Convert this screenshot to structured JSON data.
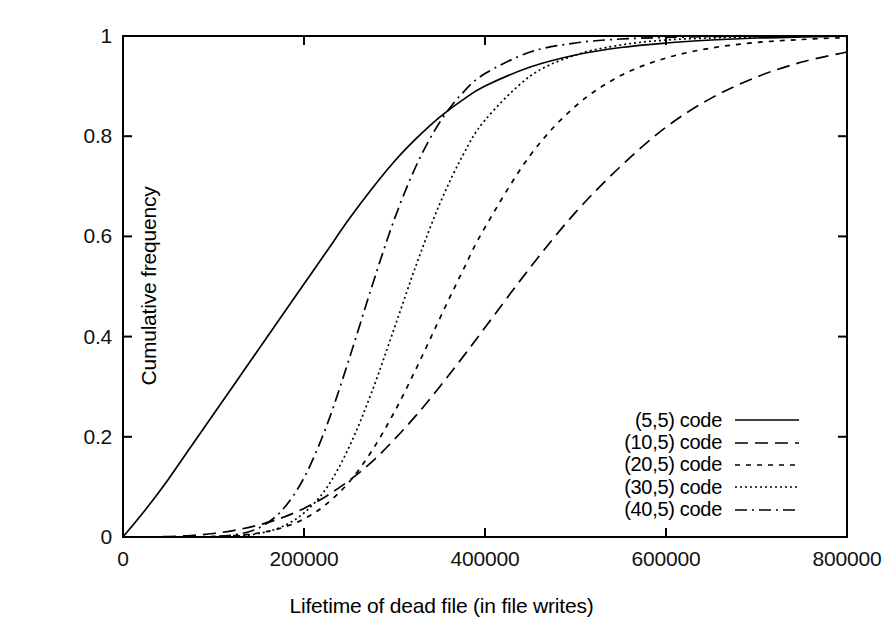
{
  "chart_data": {
    "type": "line",
    "title": "",
    "xlabel": "Lifetime of dead file (in file writes)",
    "ylabel": "Cumulative frequency",
    "xlim": [
      0,
      800000
    ],
    "ylim": [
      0,
      1
    ],
    "xticks": [
      "0",
      "200000",
      "400000",
      "600000",
      "800000"
    ],
    "xtick_values": [
      0,
      200000,
      400000,
      600000,
      800000
    ],
    "yticks": [
      "0",
      "0.2",
      "0.4",
      "0.6",
      "0.8",
      "1"
    ],
    "ytick_values": [
      0,
      0.2,
      0.4,
      0.6,
      0.8,
      1
    ],
    "grid": false,
    "legend_position": "lower right",
    "line_color": "#000000",
    "x": [
      0,
      25000,
      50000,
      75000,
      100000,
      125000,
      150000,
      175000,
      200000,
      225000,
      250000,
      275000,
      300000,
      325000,
      350000,
      375000,
      400000,
      450000,
      500000,
      550000,
      600000,
      650000,
      700000,
      750000,
      800000
    ],
    "series": [
      {
        "name": "(5,5) code",
        "dash": "solid",
        "values": [
          0,
          0.055,
          0.115,
          0.18,
          0.245,
          0.31,
          0.375,
          0.44,
          0.505,
          0.57,
          0.635,
          0.695,
          0.75,
          0.797,
          0.838,
          0.872,
          0.9,
          0.938,
          0.962,
          0.977,
          0.986,
          0.992,
          0.996,
          0.998,
          1.0
        ]
      },
      {
        "name": "(10,5) code",
        "dash": "dashed",
        "values": [
          0,
          0.0,
          0.001,
          0.003,
          0.007,
          0.014,
          0.024,
          0.038,
          0.057,
          0.082,
          0.113,
          0.15,
          0.195,
          0.245,
          0.3,
          0.358,
          0.418,
          0.538,
          0.648,
          0.74,
          0.818,
          0.876,
          0.918,
          0.948,
          0.968
        ]
      },
      {
        "name": "(20,5) code",
        "dash": "short-dashed",
        "values": [
          0,
          0.0,
          0.0,
          0.0,
          0.001,
          0.003,
          0.008,
          0.018,
          0.036,
          0.066,
          0.11,
          0.172,
          0.25,
          0.34,
          0.436,
          0.53,
          0.618,
          0.762,
          0.86,
          0.921,
          0.956,
          0.976,
          0.987,
          0.993,
          0.997
        ]
      },
      {
        "name": "(30,5) code",
        "dash": "dotted",
        "values": [
          0,
          0.0,
          0.0,
          0.0,
          0.0,
          0.002,
          0.007,
          0.02,
          0.048,
          0.098,
          0.18,
          0.29,
          0.418,
          0.548,
          0.665,
          0.76,
          0.832,
          0.92,
          0.962,
          0.982,
          0.992,
          0.996,
          0.998,
          0.999,
          1.0
        ]
      },
      {
        "name": "(40,5) code",
        "dash": "dash-dot",
        "values": [
          0,
          0.0,
          0.0,
          0.0,
          0.001,
          0.005,
          0.018,
          0.052,
          0.118,
          0.222,
          0.356,
          0.5,
          0.635,
          0.745,
          0.828,
          0.886,
          0.925,
          0.968,
          0.986,
          0.994,
          0.997,
          0.999,
          1.0,
          1.0,
          1.0
        ]
      }
    ]
  },
  "axis": {
    "x_labels": [
      "0",
      "200000",
      "400000",
      "600000",
      "800000"
    ],
    "y_labels": [
      "0",
      "0.2",
      "0.4",
      "0.6",
      "0.8",
      "1"
    ],
    "xlabel": "Lifetime of dead file (in file writes)",
    "ylabel": "Cumulative frequency"
  },
  "legend": {
    "items": [
      {
        "label": "(5,5) code"
      },
      {
        "label": "(10,5) code"
      },
      {
        "label": "(20,5) code"
      },
      {
        "label": "(30,5) code"
      },
      {
        "label": "(40,5) code"
      }
    ]
  }
}
